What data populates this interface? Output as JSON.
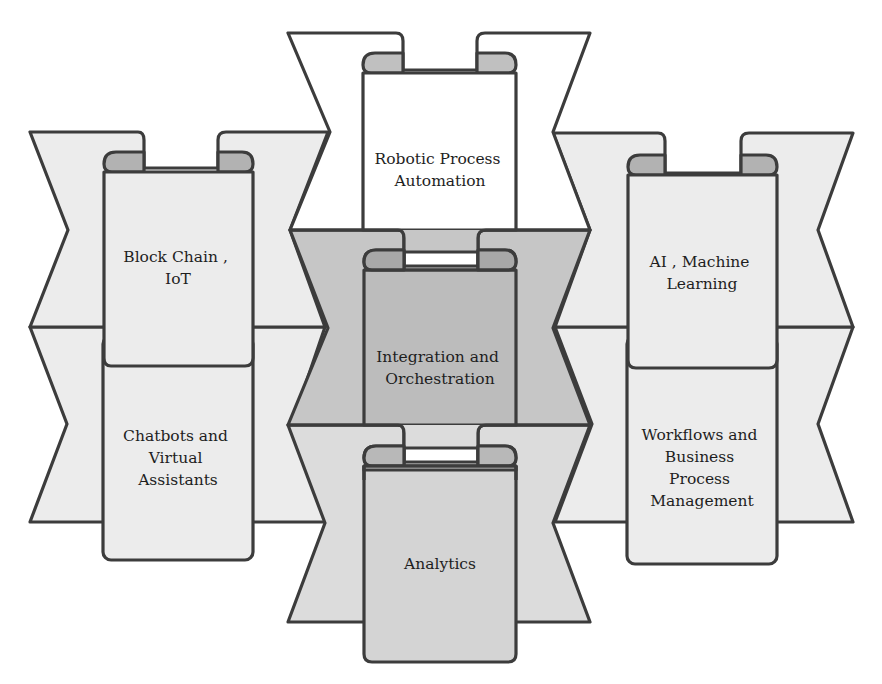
{
  "diagram": {
    "type": "banner-scroll-grid",
    "colors": {
      "outline": "#3c3c3c",
      "white_fill": "#ffffff",
      "light_fill": "#eaeaea",
      "mid_fill": "#d6d6d6",
      "dark_fill": "#b4b4b4",
      "curl_fill": "#b0b0b0",
      "text": "#1e1e1e"
    },
    "nodes": [
      {
        "id": "block-chain",
        "lines": [
          "Block Chain ,",
          "IoT"
        ],
        "column": "left",
        "row": 1
      },
      {
        "id": "chatbots",
        "lines": [
          "Chatbots and",
          "Virtual",
          "Assistants"
        ],
        "column": "left",
        "row": 2
      },
      {
        "id": "rpa",
        "lines": [
          "Robotic Process",
          "Automation"
        ],
        "column": "center",
        "row": 1
      },
      {
        "id": "integration",
        "lines": [
          "Integration and",
          "Orchestration"
        ],
        "column": "center",
        "row": 2
      },
      {
        "id": "analytics",
        "lines": [
          "Analytics"
        ],
        "column": "center",
        "row": 3
      },
      {
        "id": "ai-ml",
        "lines": [
          "AI ,  Machine",
          "Learning"
        ],
        "column": "right",
        "row": 1
      },
      {
        "id": "workflows",
        "lines": [
          "Workflows and",
          "Business",
          "Process",
          "Management"
        ],
        "column": "right",
        "row": 2
      }
    ]
  }
}
